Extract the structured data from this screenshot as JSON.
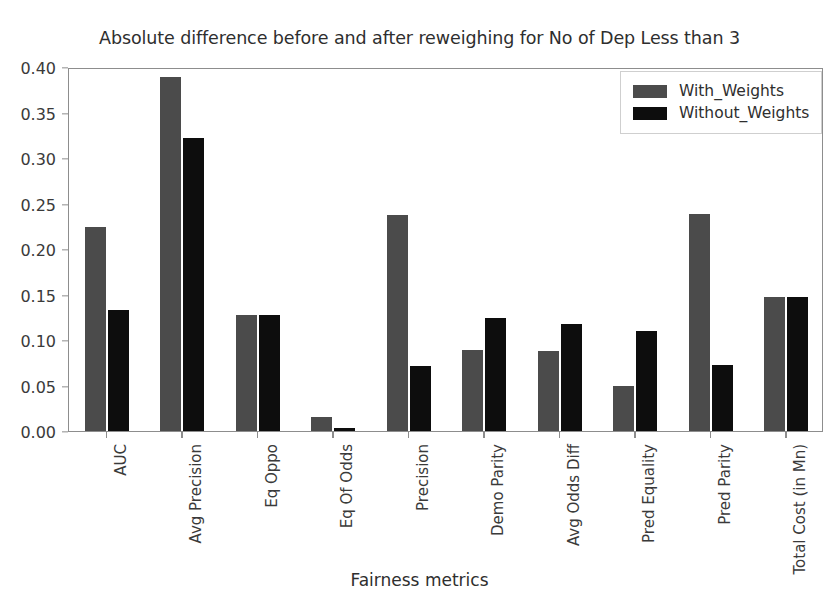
{
  "chart_data": {
    "type": "bar",
    "title": "Absolute difference before and after reweighing for No of Dep Less than 3",
    "xlabel": "Fairness metrics",
    "ylabel": "",
    "ylim": [
      0.0,
      0.4
    ],
    "yticks": [
      "0.00",
      "0.05",
      "0.10",
      "0.15",
      "0.20",
      "0.25",
      "0.30",
      "0.35",
      "0.40"
    ],
    "ytick_values": [
      0.0,
      0.05,
      0.1,
      0.15,
      0.2,
      0.25,
      0.3,
      0.35,
      0.4
    ],
    "grid": false,
    "legend_position": "upper right",
    "categories": [
      "AUC",
      "Avg Precision",
      "Eq Oppo",
      "Eq Of Odds",
      "Precision",
      "Demo Parity",
      "Avg Odds Diff",
      "Pred Equality",
      "Pred Parity",
      "Total Cost (in Mn)"
    ],
    "series": [
      {
        "name": "With_Weights",
        "color": "#4b4b4b",
        "values": [
          0.224,
          0.389,
          0.127,
          0.015,
          0.237,
          0.089,
          0.088,
          0.049,
          0.239,
          0.147
        ]
      },
      {
        "name": "Without_Weights",
        "color": "#0d0d0d",
        "values": [
          0.133,
          0.322,
          0.127,
          0.003,
          0.071,
          0.124,
          0.118,
          0.11,
          0.073,
          0.147
        ]
      }
    ]
  },
  "legend": {
    "entries": [
      {
        "label": "With_Weights"
      },
      {
        "label": "Without_Weights"
      }
    ]
  },
  "colors": {
    "series_0": "#4b4b4b",
    "series_1": "#0d0d0d",
    "axis": "#8d8d8d",
    "text": "#3a3a3a",
    "background": "#ffffff"
  }
}
